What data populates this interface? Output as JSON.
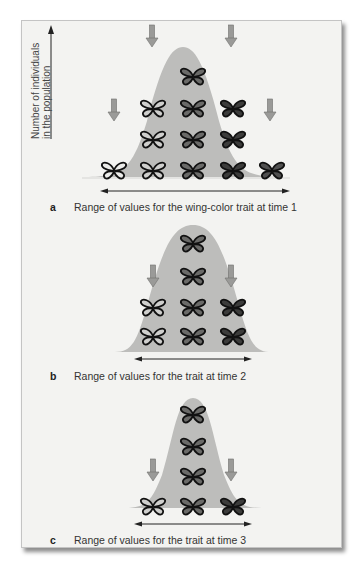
{
  "figure": {
    "y_axis_label_line1": "Number of individuals",
    "y_axis_label_line2": "in the population",
    "colors": {
      "panel_bg": "#f3f3f1",
      "curve_fill": "#bdbdbb",
      "arrow_fill": "#9a9a98",
      "arrow_stroke": "#6f6f6d",
      "butterfly_outline": "#1a1a1a"
    },
    "panels": [
      {
        "letter": "a",
        "caption": "Range of values for the wing-color trait at time 1",
        "columns": 5,
        "counts_per_column": [
          1,
          3,
          4,
          3,
          1
        ],
        "selection_arrows": 4
      },
      {
        "letter": "b",
        "caption": "Range of values for the trait at time 2",
        "columns": 3,
        "counts_per_column": [
          2,
          4,
          2
        ],
        "selection_arrows": 2
      },
      {
        "letter": "c",
        "caption": "Range of values for the trait at time 3",
        "columns": 3,
        "counts_per_column": [
          1,
          4,
          1
        ],
        "selection_arrows": 2
      }
    ]
  }
}
